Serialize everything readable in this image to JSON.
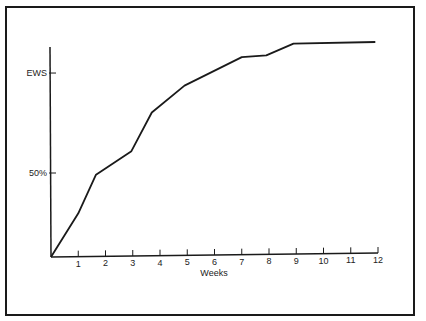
{
  "chart_data": {
    "type": "line",
    "title": "",
    "xlabel": "Weeks",
    "ylabel": "",
    "x_ticks": [
      1,
      2,
      3,
      4,
      5,
      6,
      7,
      8,
      9,
      10,
      11,
      12
    ],
    "x_tick_labels": [
      "1",
      "2",
      "3",
      "4",
      "5",
      "6",
      "7",
      "8",
      "9",
      "10",
      "11",
      "12"
    ],
    "y_ticks": [
      {
        "label": "50%",
        "value": 50
      },
      {
        "label": "EWS",
        "value": 109.5
      }
    ],
    "xlim": [
      0,
      12
    ],
    "ylim": [
      0,
      130
    ],
    "grid": false,
    "legend": null,
    "series": [
      {
        "name": "cumulative weight gain",
        "x": [
          0,
          1.0,
          1.65,
          2.95,
          3.7,
          4.9,
          7.0,
          7.9,
          8.9,
          11.9
        ],
        "y": [
          0,
          26,
          49,
          63,
          86,
          102,
          119,
          120,
          127,
          128
        ]
      }
    ]
  },
  "labels": {
    "xlabel": "Weeks",
    "ews": "EWS",
    "fifty": "50%"
  }
}
